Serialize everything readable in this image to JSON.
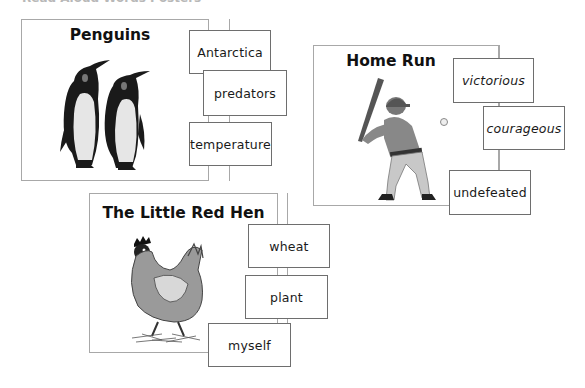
{
  "caption": "Read Aloud Words Posters",
  "cards": [
    {
      "title": "Penguins",
      "illustration": "penguins-illustration",
      "words": [
        "Antarctica",
        "predators",
        "temperature"
      ]
    },
    {
      "title": "Home Run",
      "illustration": "baseball-batter-illustration",
      "words": [
        "victorious",
        "courageous",
        "undefeated"
      ]
    },
    {
      "title": "The Little Red Hen",
      "illustration": "hen-illustration",
      "words": [
        "wheat",
        "plant",
        "myself"
      ]
    }
  ],
  "colors": {
    "card_border": "#a8a8a8",
    "box_border": "#6e6e6e",
    "text": "#111111",
    "background": "#ffffff"
  }
}
